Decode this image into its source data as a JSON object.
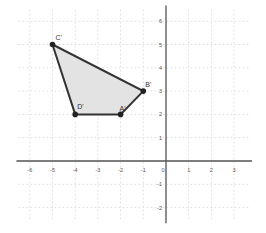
{
  "graph": {
    "x_range": [
      -6.5,
      3.7
    ],
    "y_range": [
      -2.5,
      6.5
    ],
    "x_ticks": [
      -6,
      -5,
      -4,
      -3,
      -2,
      -1,
      0,
      1,
      2,
      3
    ],
    "y_ticks": [
      -2,
      -1,
      1,
      2,
      3,
      4,
      5,
      6
    ],
    "grid": true
  },
  "polygon": {
    "fill": "#e3e3e3",
    "stroke": "#333333",
    "vertices": [
      {
        "label": "C'",
        "x": -5,
        "y": 5
      },
      {
        "label": "B'",
        "x": -1,
        "y": 3
      },
      {
        "label": "A'",
        "x": -2,
        "y": 2
      },
      {
        "label": "D'",
        "x": -4,
        "y": 2
      }
    ]
  }
}
